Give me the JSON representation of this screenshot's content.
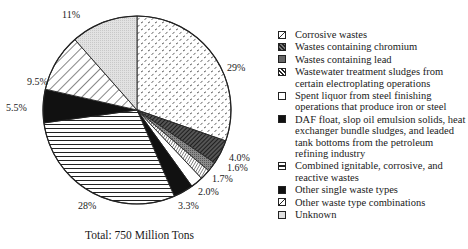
{
  "chart_data": {
    "type": "pie",
    "title": "",
    "caption": "Total:  750 Million Tons",
    "start_angle": "12 o'clock",
    "direction": "clockwise",
    "legend_position": "right",
    "slices": [
      {
        "label": "Corrosive wastes",
        "value": 29,
        "value_label": "29%",
        "pattern": "dots-dashes"
      },
      {
        "label": "Wastes containing chromium",
        "value": 4.0,
        "value_label": "4.0%",
        "pattern": "dense-diagonal-dark"
      },
      {
        "label": "Wastes containing lead",
        "value": 1.6,
        "value_label": "1.6%",
        "pattern": "gray"
      },
      {
        "label": "Wastewater treatment sludges from certain electroplating operations",
        "value": 1.7,
        "value_label": "1.7%",
        "pattern": "vertical-hatch"
      },
      {
        "label": "Spent liquor from steel  finishing operations that produce iron or steel",
        "value": 2.0,
        "value_label": "2.0%",
        "pattern": "white"
      },
      {
        "label": "DAF float, slop oil emulsion solids,  heat exchanger bundle sludges, and leaded tank bottoms from the petroleum refining industry",
        "value": 3.3,
        "value_label": "3.3%",
        "pattern": "black"
      },
      {
        "label": "Combined ignitable, corrosive, and reactive wastes",
        "value": 28,
        "value_label": "28%",
        "pattern": "horizontal-lines"
      },
      {
        "label": "Other single waste types",
        "value": 5.5,
        "value_label": "5.5%",
        "pattern": "black"
      },
      {
        "label": "Other waste type combinations",
        "value": 9.5,
        "value_label": "9.5%",
        "pattern": "diagonal-lines"
      },
      {
        "label": "Unknown",
        "value": 11,
        "value_label": "11%",
        "pattern": "light-gray"
      }
    ]
  },
  "labels": {
    "total": "Total:  750 Million Tons"
  },
  "legend": [
    {
      "line1": "Corrosive wastes"
    },
    {
      "line1": "Wastes containing chromium"
    },
    {
      "line1": " Wastes containing lead"
    },
    {
      "line1": "Wastewater treatment sludges from certain electroplating operations"
    },
    {
      "line1": "Spent liquor from steel  finishing operations that produce iron or steel"
    },
    {
      "line1": "DAF float, slop oil emulsion solids,  heat exchanger bundle sludges, and leaded tank bottoms from the petroleum refining industry"
    },
    {
      "line1": "Combined ignitable, corrosive, and reactive wastes"
    },
    {
      "line1": "Other single waste types"
    },
    {
      "line1": "Other waste type combinations"
    },
    {
      "line1": "Unknown"
    }
  ]
}
